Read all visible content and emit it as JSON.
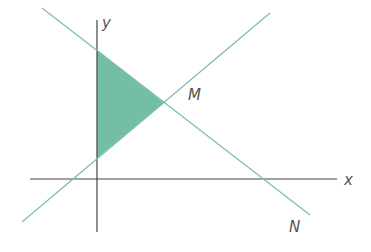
{
  "diagram": {
    "type": "coordinate-geometry",
    "labels": {
      "x_axis": "x",
      "y_axis": "y",
      "point_m": "M",
      "line_n": "N"
    },
    "colors": {
      "axis": "#333333",
      "line": "#7fbfa8",
      "shade": "#5cb398",
      "text": "#555555"
    }
  }
}
